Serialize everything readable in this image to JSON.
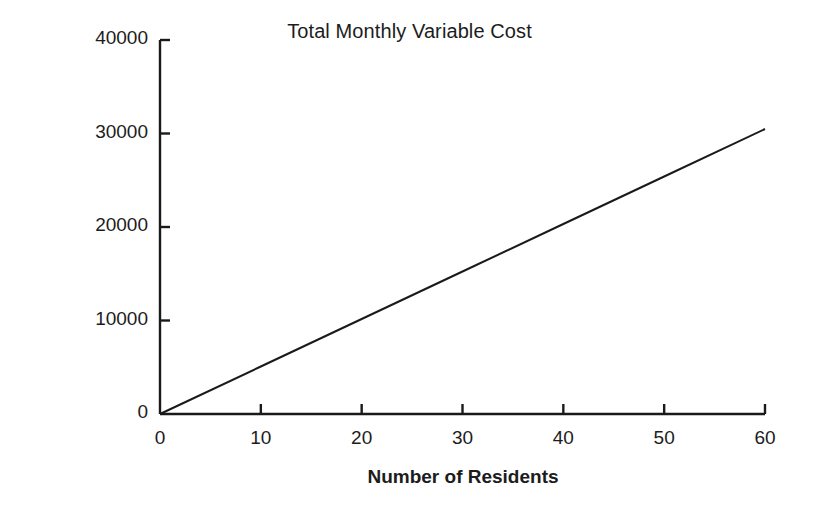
{
  "chart_data": {
    "type": "line",
    "title": "Total Monthly Variable Cost",
    "xlabel": "Number of Residents",
    "ylabel": "Total Monthly Variable Cost",
    "xlim": [
      0,
      60
    ],
    "ylim": [
      0,
      40000
    ],
    "grid": false,
    "legend": null,
    "x_ticks": [
      0,
      10,
      20,
      30,
      40,
      50,
      60
    ],
    "x_tick_labels": [
      "0",
      "10",
      "20",
      "30",
      "40",
      "50",
      "60"
    ],
    "y_ticks": [
      0,
      10000,
      20000,
      30000,
      40000
    ],
    "y_tick_labels": [
      "0",
      "10000",
      "20000",
      "30000",
      "40000"
    ],
    "series": [
      {
        "name": "Total Monthly Variable Cost",
        "color": "#1a1a1a",
        "x": [
          0,
          10,
          20,
          30,
          40,
          50,
          60
        ],
        "values": [
          0,
          5080,
          10160,
          15240,
          20320,
          25400,
          30480
        ]
      }
    ]
  },
  "axes": {
    "line_color": "#1a1a1a",
    "tick_direction": "in"
  }
}
